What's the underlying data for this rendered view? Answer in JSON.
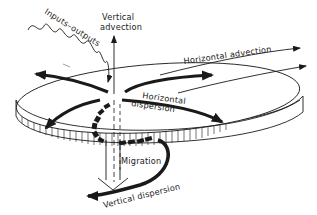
{
  "diagram": {
    "title": "",
    "colors": {
      "ink": "#1a1a1a",
      "background": "#ffffff"
    },
    "labels": {
      "inputs_outputs": "Inputs–outputs",
      "vertical_advection_line1": "Vertical",
      "vertical_advection_line2": "advection",
      "horizontal_advection": "Horizontal advection",
      "horizontal_dispersion_line1": "Horizontal",
      "horizontal_dispersion_line2": "dispersion",
      "migration": "Migration",
      "vertical_dispersion": "Vertical dispersion"
    },
    "elements": [
      "disc-volume",
      "wavy-inputs-outputs-arrow",
      "vertical-advection-arrow",
      "horizontal-advection-arrows",
      "horizontal-dispersion-arrows",
      "migration-arrow",
      "vertical-dispersion-arrow"
    ]
  }
}
